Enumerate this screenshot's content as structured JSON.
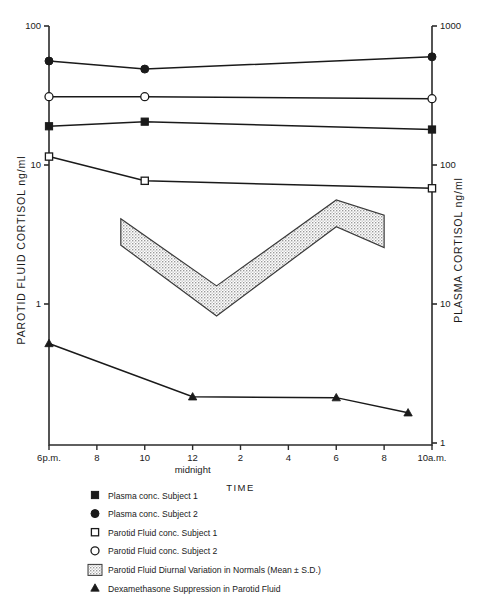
{
  "chart_data": {
    "type": "line",
    "title": "",
    "xlabel": "TIME",
    "ylabel": "PAROTID FLUID CORTISOL  ng/ml",
    "y2label": "PLASMA  CORTISOL  ng/ml",
    "x_tick_labels": [
      "6p.m.",
      "8",
      "10",
      "12",
      "2",
      "4",
      "6",
      "8",
      "10a.m."
    ],
    "x_sublabel": "midnight",
    "x_sublabel_index": 3,
    "x_hours": [
      18,
      20,
      22,
      24,
      26,
      28,
      30,
      32,
      34
    ],
    "xlim": [
      18,
      34
    ],
    "y_tick_labels": [
      "100",
      "10",
      "1"
    ],
    "y_tick_values": [
      100,
      10,
      1
    ],
    "ylim": [
      0.26,
      100
    ],
    "y2_tick_labels": [
      "1000",
      "100",
      "10",
      "1"
    ],
    "y2_tick_values": [
      1000,
      100,
      10,
      1
    ],
    "y2lim": [
      2.6,
      1000
    ],
    "y_scale": "log",
    "grid": false,
    "legend_position": "below-plot",
    "series": [
      {
        "name": "Plasma conc. Subject 1",
        "marker": "filled-square",
        "axis": "right",
        "x": [
          18,
          22,
          34
        ],
        "values": [
          190,
          205,
          180
        ]
      },
      {
        "name": "Plasma conc. Subject 2",
        "marker": "filled-circle",
        "axis": "right",
        "x": [
          18,
          22,
          34
        ],
        "values": [
          560,
          490,
          600
        ]
      },
      {
        "name": "Parotid Fluid conc. Subject 1",
        "marker": "open-square",
        "axis": "left",
        "x": [
          18,
          22,
          34
        ],
        "values": [
          11.5,
          7.7,
          6.8
        ]
      },
      {
        "name": "Parotid Fluid conc. Subject 2",
        "marker": "open-circle",
        "axis": "left",
        "x": [
          18,
          22,
          34
        ],
        "values": [
          31,
          31,
          30
        ]
      },
      {
        "name": "Dexamethasone Suppression in Parotid Fluid",
        "marker": "filled-triangle",
        "axis": "left",
        "x": [
          18,
          24,
          30,
          33
        ],
        "values": [
          0.52,
          0.215,
          0.212,
          0.165
        ]
      }
    ],
    "band": {
      "name": "Parotid Fluid Diurnal Variation in Normals (Mean ± S.D.)",
      "fill": "stipple",
      "x": [
        21,
        25,
        30,
        32
      ],
      "upper": [
        4.1,
        1.35,
        5.6,
        4.35
      ],
      "lower": [
        2.65,
        0.82,
        3.6,
        2.55
      ]
    },
    "annotations": []
  },
  "legend": {
    "items": [
      {
        "marker": "filled-square",
        "label": "Plasma conc. Subject 1"
      },
      {
        "marker": "filled-circle",
        "label": "Plasma conc. Subject 2"
      },
      {
        "marker": "open-square",
        "label": "Parotid Fluid conc. Subject 1"
      },
      {
        "marker": "open-circle",
        "label": "Parotid Fluid conc. Subject 2"
      },
      {
        "marker": "stipple-swatch",
        "label": "Parotid Fluid Diurnal Variation in Normals (Mean ± S.D.)"
      },
      {
        "marker": "filled-triangle",
        "label": "Dexamethasone Suppression in Parotid Fluid"
      }
    ]
  },
  "colors": {
    "ink": "#1a1a1a",
    "axis": "#2b2b2b",
    "band_fill": "#e8e8e8",
    "band_stroke": "#3a3a3a",
    "background": "#ffffff"
  }
}
